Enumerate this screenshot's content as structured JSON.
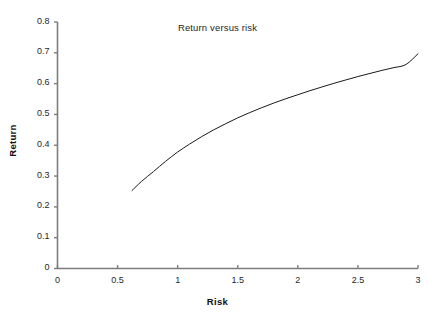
{
  "chart_data": {
    "type": "line",
    "title": "Return versus risk",
    "xlabel": "Risk",
    "ylabel": "Return",
    "xlim": [
      0,
      3
    ],
    "ylim": [
      0,
      0.8
    ],
    "grid": false,
    "legend": null,
    "xticks": [
      0,
      0.5,
      1,
      1.5,
      2,
      2.5,
      3
    ],
    "xticklabels": [
      "0",
      "0.5",
      "1",
      "1.5",
      "2",
      "2.5",
      "3"
    ],
    "yticks": [
      0,
      0.1,
      0.2,
      0.3,
      0.4,
      0.5,
      0.6,
      0.7,
      0.8
    ],
    "yticklabels": [
      "0",
      "0.1",
      "0.2",
      "0.3",
      "0.4",
      "0.5",
      "0.6",
      "0.7",
      "0.8"
    ],
    "series": [
      {
        "name": "efficient-frontier",
        "color": "#1a1a1a",
        "linewidth": 1,
        "x": [
          0.62,
          0.7,
          0.8,
          0.9,
          1.0,
          1.1,
          1.2,
          1.3,
          1.4,
          1.5,
          1.6,
          1.7,
          1.8,
          1.9,
          2.0,
          2.1,
          2.2,
          2.3,
          2.4,
          2.5,
          2.6,
          2.7,
          2.8,
          2.9,
          3.0
        ],
        "y": [
          0.253,
          0.283,
          0.315,
          0.348,
          0.378,
          0.404,
          0.428,
          0.45,
          0.47,
          0.489,
          0.506,
          0.522,
          0.537,
          0.551,
          0.564,
          0.577,
          0.589,
          0.601,
          0.612,
          0.623,
          0.633,
          0.643,
          0.652,
          0.662,
          0.697
        ]
      }
    ],
    "annotations": []
  },
  "axes": {
    "x_axis_name": "Risk",
    "y_axis_name": "Return",
    "axis_color": "#7d7d7d"
  }
}
